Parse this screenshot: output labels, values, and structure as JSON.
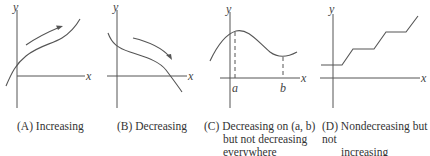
{
  "panels": [
    {
      "id": "A",
      "caption_tag": "(A)",
      "caption": "Increasing",
      "axis_labels": {
        "x": "x",
        "y": "y"
      }
    },
    {
      "id": "B",
      "caption_tag": "(B)",
      "caption": "Decreasing",
      "axis_labels": {
        "x": "x",
        "y": "y"
      }
    },
    {
      "id": "C",
      "caption_tag": "(C)",
      "caption_line1": "Decreasing on (a, b)",
      "caption_line2": "but not decreasing",
      "caption_line3": "everywhere",
      "axis_labels": {
        "x": "x",
        "y": "y"
      },
      "tick_labels": [
        "a",
        "b"
      ]
    },
    {
      "id": "D",
      "caption_tag": "(D)",
      "caption_line1": "Nondecreasing but not",
      "caption_line2": "increasing",
      "axis_labels": {
        "x": "x",
        "y": "y"
      }
    }
  ]
}
